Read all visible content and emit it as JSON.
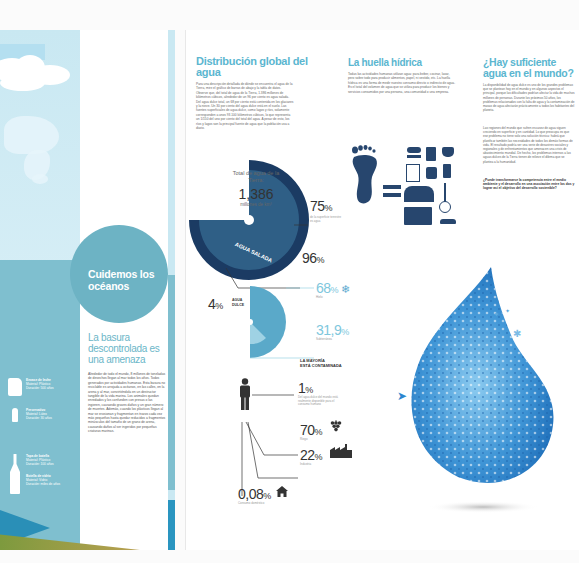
{
  "left_page": {
    "circle_title": "Cuidemos los océanos",
    "subtitle": "La basura descontrolada es una amenaza",
    "body": "Alrededor de todo el mundo, 8 millones de toneladas de desechos llegan al mar todos los años. Todos generados por actividades humanas. Esta basura no reciclable es arrojada a océanos, en las calles, en la arena y al mar, convirtiéndola en un destructor tangible de la vida marina. Los animales quedan enredados y los confunden con presas o las ingieren, causando graves daños y un gran número de muertes. Además, cuando los plásticos llegan al mar se erosionan y fragmentan en trozos cada vez más pequeños hasta quedar reducidos a fragmentos minúsculos del tamaño de un grano de arena, causando daños al ser ingeridos por pequeñas criaturas marinas.",
    "trash_items": [
      {
        "title": "Envase de leche",
        "line1": "Material: Plástico",
        "line2": "Duración: 500 años",
        "icon": "jug-icon"
      },
      {
        "title": "Preservativo",
        "line1": "Material: Látex",
        "line2": "Duración: 30 años",
        "icon": "condom-icon"
      },
      {
        "title": "Tapa de botella",
        "line1": "Material: Plástico",
        "line2": "Duración: 100 años",
        "icon": "bottle-icon"
      },
      {
        "title": "Botella de vidrio",
        "line1": "Material: Vidrio",
        "line2": "Duración: miles de años",
        "icon": "glass-bottle-icon"
      }
    ]
  },
  "section_distribution": {
    "title": "Distribución global del agua",
    "body": "Para una descripción detallada de dónde se encuentra el agua de la Tierra, mire el gráfico de barras de abajo y la tabla de datos. Observe que, del total de agua de la Tierra, 1.386 millones de kilómetros cúbicos, alrededor de un 96 por ciento es agua salada. Del agua dulce total, un 68 por ciento está contenida en los glaciares y la nieve. Un 30 por ciento del agua dulce está en el suelo. Las fuentes superficiales de agua dulce, como lagos y ríos, solamente corresponden a unos 93.100 kilómetros cúbicos, lo que representa un 1/150 del uno por ciento del total del agua. A pesar de esto, los ríos y lagos son la principal fuente de agua que la población usa a diario.",
    "total_label": "Total de agua de la Tierra:",
    "total_value": "1,386",
    "total_unit": "millones de km³",
    "salt_label": "AGUA SALADA",
    "stats": [
      {
        "value": "75",
        "unit": "%",
        "caption": "de la superficie terrestre es agua"
      },
      {
        "value": "96",
        "unit": "%",
        "caption": ""
      },
      {
        "value": "68",
        "unit": "%",
        "caption": "Hielo",
        "icon": "snowflake-icon"
      },
      {
        "value": "31,9",
        "unit": "%",
        "caption": "Subterránea"
      }
    ],
    "fresh": {
      "value": "4",
      "unit": "%",
      "label_line1": "AGUA",
      "label_line2": "DULCE"
    },
    "contamination": {
      "title_line1": "LA MAYORÍA",
      "title_line2": "ESTÁ CONTAMINADA",
      "items": [
        {
          "value": "1",
          "unit": "%",
          "caption": "Del agua dulce del mundo está realmente disponible para el consumo humano"
        },
        {
          "value": "70",
          "unit": "%",
          "caption": "Riego",
          "icon": "grapes-icon"
        },
        {
          "value": "22",
          "unit": "%",
          "caption": "Industria",
          "icon": "factory-icon"
        },
        {
          "value": "0,08",
          "unit": "%",
          "caption": "Consumo doméstico",
          "icon": "house-icon"
        }
      ]
    },
    "colors": {
      "dark": "#1b3b63",
      "mid": "#2f6f93",
      "light": "#6fb6d4",
      "pale": "#9fd2e4"
    }
  },
  "section_footprint": {
    "title": "La huella hídrica",
    "body": "Todas las actividades humanas utilizan agua: para beber, cocinar, lavar, pero sobre todo para producir alimentos, papel, ni vestido, etc. La huella hídrica es una forma de medir nuestro consumo directo o indirecto de agua. Es el total del volumen de agua que se utiliza para producir los bienes y servicios consumidos por una persona, una comunidad o una empresa."
  },
  "section_enough": {
    "title": "¿Hay suficiente agua en el mundo?",
    "body1": "La disponibilidad de agua dulce es uno de los grandes problemas que se plantean hoy en el mundo y en algunos aspectos el principal, porque las dificultades podrían afectar la vida de muchos millones de personas. Durante los próximos 50 años, los problemas relacionados con la falta de agua y la contaminación de masas de agua afectarán prácticamente a todos los habitantes del planeta.",
    "body2": "Las regiones del mundo que sufren escasez de agua siguen creciendo en superficie y en cantidad. Lo que preocupa es que ese problema no tiene solo una solución técnica: habrá que planificar también las necesidades de todos los demás formas de vida. El resultado podría ser una serie de desastres sociales y regionales y de enfrentamientos que amenacen una crisis de abastecimiento mundial. De hecho, los problemas internos a las aguas dulces de la Tierra tienen de relieve el dilema que se plantea a la humanidad.",
    "question": "¿Puede transformarse la competencia entre el medio ambiente y el desarrollo en una asociación entre los dos y lograr así el objetivo del desarrollo sostenible?"
  }
}
